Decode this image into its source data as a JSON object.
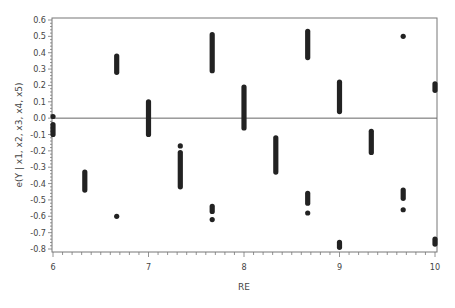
{
  "chart_data": {
    "type": "scatter",
    "title": "",
    "xlabel": "RE",
    "ylabel": "e(Y | x1, x2, x3, x4, x5)",
    "xlim": [
      6,
      10
    ],
    "ylim": [
      -0.8,
      0.6
    ],
    "x_ticks": [
      "6",
      "7",
      "8",
      "9",
      "10"
    ],
    "y_ticks": [
      "0.6",
      "0.5",
      "0.4",
      "0.3",
      "0.2",
      "0.1",
      "0.0",
      "-0.1",
      "-0.2",
      "-0.3",
      "-0.4",
      "-0.5",
      "-0.6",
      "-0.7",
      "-0.8"
    ],
    "grid": false,
    "reference_line_y": 0.0,
    "legend": null,
    "marker_color": "#222222",
    "clusters": [
      {
        "x": 6.0,
        "y_ranges": [
          [
            0.01,
            0.01
          ],
          [
            -0.04,
            -0.1
          ]
        ]
      },
      {
        "x": 6.333,
        "y_ranges": [
          [
            -0.33,
            -0.44
          ]
        ]
      },
      {
        "x": 6.667,
        "y_ranges": [
          [
            0.38,
            0.28
          ],
          [
            -0.6,
            -0.6
          ]
        ]
      },
      {
        "x": 7.0,
        "y_ranges": [
          [
            0.1,
            -0.1
          ]
        ]
      },
      {
        "x": 7.333,
        "y_ranges": [
          [
            -0.17,
            -0.17
          ],
          [
            -0.21,
            -0.42
          ]
        ]
      },
      {
        "x": 7.667,
        "y_ranges": [
          [
            0.51,
            0.29
          ],
          [
            -0.54,
            -0.57
          ],
          [
            -0.62,
            -0.62
          ]
        ]
      },
      {
        "x": 8.0,
        "y_ranges": [
          [
            0.19,
            -0.06
          ]
        ]
      },
      {
        "x": 8.333,
        "y_ranges": [
          [
            -0.12,
            -0.33
          ]
        ]
      },
      {
        "x": 8.667,
        "y_ranges": [
          [
            0.53,
            0.37
          ],
          [
            -0.46,
            -0.52
          ],
          [
            -0.58,
            -0.58
          ]
        ]
      },
      {
        "x": 9.0,
        "y_ranges": [
          [
            0.22,
            0.04
          ],
          [
            -0.76,
            -0.79
          ]
        ]
      },
      {
        "x": 9.333,
        "y_ranges": [
          [
            -0.08,
            -0.21
          ]
        ]
      },
      {
        "x": 9.667,
        "y_ranges": [
          [
            0.5,
            0.5
          ],
          [
            -0.44,
            -0.49
          ],
          [
            -0.56,
            -0.56
          ]
        ]
      },
      {
        "x": 10.0,
        "y_ranges": [
          [
            0.21,
            0.17
          ],
          [
            -0.74,
            -0.77
          ]
        ]
      }
    ]
  }
}
